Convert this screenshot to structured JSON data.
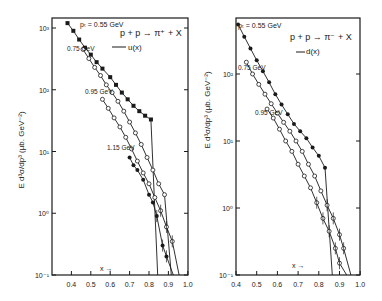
{
  "figure": {
    "panels": [
      {
        "id": "left",
        "reaction": "p + p → π⁺ + X",
        "model_legend": "u(x)",
        "ylabel": "E d³σ/dp³ (μb. GeV⁻²)",
        "xlabel": "x →",
        "xticks": [
          "0.4",
          "0.5",
          "0.6",
          "0.7",
          "0.8",
          "0.9",
          "1.0"
        ],
        "yticks": [
          "10⁻¹",
          "10⁰",
          "10¹",
          "10²",
          "10³"
        ],
        "curve_labels": [
          "pₜ = 0.55 GeV",
          "0.75 GeV",
          "0.95 GeV",
          "1.15 GeV"
        ]
      },
      {
        "id": "right",
        "reaction": "p + p → π⁻ + X",
        "model_legend": "d(x)",
        "ylabel": "E d³σ/dp³ (μb. GeV⁻²)",
        "xlabel": "x →",
        "xticks": [
          "0.4",
          "0.5",
          "0.6",
          "0.7",
          "0.8",
          "0.9",
          "1.0"
        ],
        "yticks": [
          "10⁻¹",
          "10⁰",
          "10¹",
          "10²"
        ],
        "curve_labels": [
          "pₜ = 0.55 GeV",
          "0.75 GeV",
          "0.95 GeV"
        ]
      }
    ]
  },
  "chart_data": [
    {
      "type": "scatter",
      "title": "p + p → π⁺ + X",
      "legend": "u(x)",
      "xlabel": "x",
      "ylabel": "E d³σ/dp³ (μb. GeV⁻²)",
      "yscale": "log",
      "xlim": [
        0.3,
        1.0
      ],
      "ylim": [
        0.1,
        1300
      ],
      "grid": false,
      "series": [
        {
          "name": "pT = 0.55 GeV",
          "marker": "filled-square",
          "x": [
            0.38,
            0.41,
            0.44,
            0.47,
            0.5,
            0.53,
            0.56,
            0.6,
            0.63,
            0.66,
            0.69,
            0.72,
            0.75,
            0.78,
            0.81
          ],
          "y": [
            1200,
            900,
            650,
            480,
            370,
            280,
            220,
            160,
            120,
            90,
            70,
            55,
            45,
            38,
            33
          ]
        },
        {
          "name": "0.75 GeV",
          "marker": "open-circle",
          "x": [
            0.46,
            0.49,
            0.52,
            0.55,
            0.58,
            0.61,
            0.64,
            0.67,
            0.7,
            0.73,
            0.76,
            0.79,
            0.82,
            0.85,
            0.88
          ],
          "y": [
            450,
            320,
            230,
            170,
            120,
            90,
            65,
            45,
            30,
            20,
            13,
            8,
            5,
            3,
            2
          ]
        },
        {
          "name": "0.95 GeV",
          "marker": "open-circle",
          "x": [
            0.56,
            0.59,
            0.62,
            0.65,
            0.68,
            0.71,
            0.74,
            0.77,
            0.8,
            0.83,
            0.86,
            0.89,
            0.92
          ],
          "y": [
            70,
            50,
            35,
            25,
            17,
            11,
            7,
            4.5,
            3,
            1.8,
            1.1,
            0.6,
            0.35
          ]
        },
        {
          "name": "1.15 GeV",
          "marker": "filled-circle",
          "x": [
            0.7,
            0.72,
            0.74,
            0.77,
            0.8,
            0.82,
            0.84,
            0.87,
            0.89
          ],
          "y": [
            8,
            6,
            5,
            3.5,
            2,
            1.5,
            0.9,
            0.3,
            0.2
          ]
        }
      ]
    },
    {
      "type": "scatter",
      "title": "p + p → π⁻ + X",
      "legend": "d(x)",
      "xlabel": "x",
      "ylabel": "E d³σ/dp³ (μb. GeV⁻²)",
      "yscale": "log",
      "xlim": [
        0.4,
        1.0
      ],
      "ylim": [
        0.1,
        700
      ],
      "grid": false,
      "series": [
        {
          "name": "pT = 0.55 GeV",
          "marker": "filled-circle",
          "x": [
            0.41,
            0.44,
            0.47,
            0.5,
            0.53,
            0.56,
            0.59,
            0.62,
            0.65,
            0.68,
            0.71,
            0.74,
            0.77,
            0.8,
            0.83
          ],
          "y": [
            550,
            360,
            240,
            160,
            110,
            75,
            50,
            35,
            25,
            18,
            14,
            11,
            8,
            6,
            4
          ]
        },
        {
          "name": "0.75 GeV",
          "marker": "open-circle",
          "x": [
            0.45,
            0.48,
            0.51,
            0.54,
            0.57,
            0.6,
            0.63,
            0.66,
            0.69,
            0.72,
            0.75,
            0.78,
            0.81,
            0.84,
            0.87,
            0.9,
            0.92
          ],
          "y": [
            150,
            100,
            70,
            50,
            36,
            26,
            19,
            14,
            10,
            7,
            4.5,
            3,
            1.8,
            1.1,
            0.7,
            0.4,
            0.25
          ]
        },
        {
          "name": "0.95 GeV",
          "marker": "open-circle",
          "x": [
            0.55,
            0.58,
            0.61,
            0.64,
            0.67,
            0.7,
            0.73,
            0.76,
            0.79,
            0.82,
            0.85,
            0.88,
            0.9
          ],
          "y": [
            30,
            22,
            15,
            10,
            7,
            4.5,
            3,
            2,
            1.2,
            0.7,
            0.45,
            0.25,
            0.15
          ]
        }
      ]
    }
  ]
}
